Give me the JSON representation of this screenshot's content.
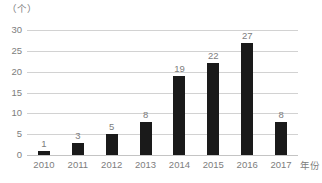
{
  "chart_data": {
    "type": "bar",
    "title": "",
    "subtitle": "",
    "xlabel": "年份",
    "ylabel": "",
    "unit_label": "（个）",
    "categories": [
      "2010",
      "2011",
      "2012",
      "2013",
      "2014",
      "2015",
      "2016",
      "2017"
    ],
    "values": [
      1,
      3,
      5,
      8,
      19,
      22,
      27,
      8
    ],
    "value_labels": [
      "1",
      "3",
      "5",
      "8",
      "19",
      "22",
      "27",
      "8"
    ],
    "ylim": [
      0,
      30
    ],
    "ytick_values": [
      0,
      5,
      10,
      15,
      20,
      25,
      30
    ],
    "ytick_labels": [
      "0",
      "5",
      "10",
      "15",
      "20",
      "25",
      "30"
    ],
    "grid": "horizontal",
    "legend": "none",
    "series": [
      {
        "name": "",
        "values": [
          1,
          3,
          5,
          8,
          19,
          22,
          27,
          8
        ],
        "color": "#1a1a1a"
      }
    ],
    "colors": {
      "bar": "#1a1a1a",
      "gridline": "#d2d2d2",
      "axis": "#c4c4c4",
      "text": "#7d7d7d",
      "background": "#ffffff"
    }
  }
}
